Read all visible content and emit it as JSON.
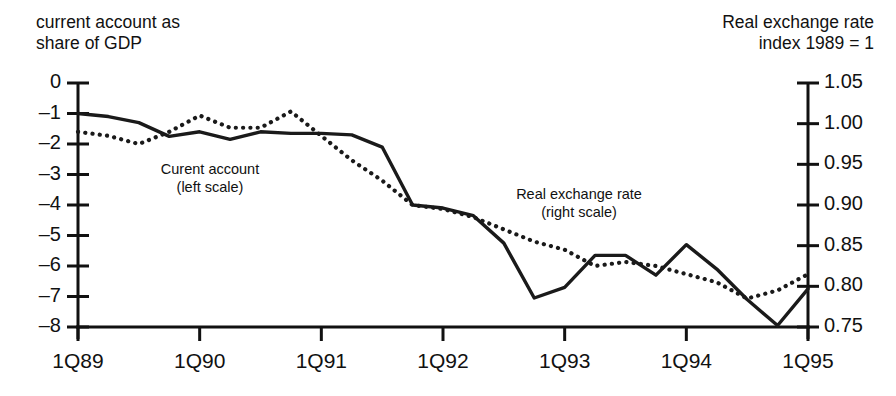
{
  "titles": {
    "left": "current account as\nshare of GDP",
    "right": "Real exchange rate\nindex 1989 = 1"
  },
  "annotations": {
    "current_account": "Curent account\n(left scale)",
    "real_exchange": "Real exchange rate\n(right scale)"
  },
  "chart_data": {
    "type": "line",
    "title": "",
    "subtitle": "",
    "xlabel": "",
    "ylabel": "current account as share of GDP",
    "y2label": "Real exchange rate index 1989 = 1",
    "grid": false,
    "legend": "inline-annotations",
    "x": [
      "1Q89",
      "2Q89",
      "3Q89",
      "4Q89",
      "1Q90",
      "2Q90",
      "3Q90",
      "4Q90",
      "1Q91",
      "2Q91",
      "3Q91",
      "4Q91",
      "1Q92",
      "2Q92",
      "3Q92",
      "4Q92",
      "1Q93",
      "2Q93",
      "3Q93",
      "4Q93",
      "1Q94",
      "2Q94",
      "3Q94",
      "4Q94",
      "1Q95"
    ],
    "x_tick_labels": [
      "1Q89",
      "1Q90",
      "1Q91",
      "1Q92",
      "1Q93",
      "1Q94",
      "1Q95"
    ],
    "x_tick_index": [
      0,
      4,
      8,
      12,
      16,
      20,
      24
    ],
    "yticks": [
      0,
      -1,
      -2,
      -3,
      -4,
      -5,
      -6,
      -7,
      -8
    ],
    "ylim": [
      -8,
      0
    ],
    "y2ticks": [
      1.05,
      1.0,
      0.95,
      0.9,
      0.85,
      0.8,
      0.75
    ],
    "y2lim": [
      0.75,
      1.05
    ],
    "series": [
      {
        "name": "Curent account (left scale)",
        "axis": "left",
        "style": "solid",
        "color": "#1a1a1a",
        "values": [
          -1.0,
          -1.1,
          -1.3,
          -1.75,
          -1.6,
          -1.85,
          -1.6,
          -1.65,
          -1.65,
          -1.7,
          -2.1,
          -4.0,
          -4.1,
          -4.35,
          -5.25,
          -7.05,
          -6.7,
          -5.65,
          -5.65,
          -6.3,
          -5.3,
          -6.1,
          -7.1,
          -7.95,
          -6.75
        ]
      },
      {
        "name": "Real exchange rate (right scale)",
        "axis": "right",
        "style": "dotted",
        "color": "#1a1a1a",
        "values": [
          0.99,
          0.985,
          0.975,
          0.99,
          1.01,
          0.995,
          0.995,
          1.015,
          0.985,
          0.955,
          0.93,
          0.9,
          0.895,
          0.885,
          0.87,
          0.855,
          0.845,
          0.825,
          0.83,
          0.825,
          0.815,
          0.805,
          0.785,
          0.795,
          0.815
        ]
      }
    ]
  }
}
